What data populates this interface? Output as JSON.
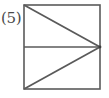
{
  "figure": {
    "label": "(5)",
    "background_color": "#ffffff",
    "stroke_color": "#5a5a5a",
    "fill_color": "#ffffff",
    "stroke_width": 1.6,
    "square": {
      "left": 24,
      "top": 5,
      "right": 100,
      "bottom": 89,
      "width": 76,
      "height": 84
    },
    "vertices": {
      "top_left": [
        24,
        5
      ],
      "top_right": [
        100,
        5
      ],
      "bottom_right": [
        100,
        89
      ],
      "bottom_left": [
        24,
        89
      ],
      "mid_left": [
        24,
        47
      ],
      "mid_right": [
        100,
        47
      ]
    },
    "lines": [
      {
        "name": "square-outline-top",
        "from": [
          24,
          5
        ],
        "to": [
          100,
          5
        ]
      },
      {
        "name": "square-outline-right",
        "from": [
          100,
          5
        ],
        "to": [
          100,
          89
        ]
      },
      {
        "name": "square-outline-bottom",
        "from": [
          100,
          89
        ],
        "to": [
          24,
          89
        ]
      },
      {
        "name": "square-outline-left",
        "from": [
          24,
          89
        ],
        "to": [
          24,
          5
        ]
      },
      {
        "name": "horizontal-midline",
        "from": [
          24,
          47
        ],
        "to": [
          100,
          47
        ]
      },
      {
        "name": "upper-diagonal",
        "from": [
          24,
          5
        ],
        "to": [
          100,
          47
        ]
      },
      {
        "name": "lower-diagonal",
        "from": [
          24,
          89
        ],
        "to": [
          100,
          47
        ]
      }
    ]
  }
}
